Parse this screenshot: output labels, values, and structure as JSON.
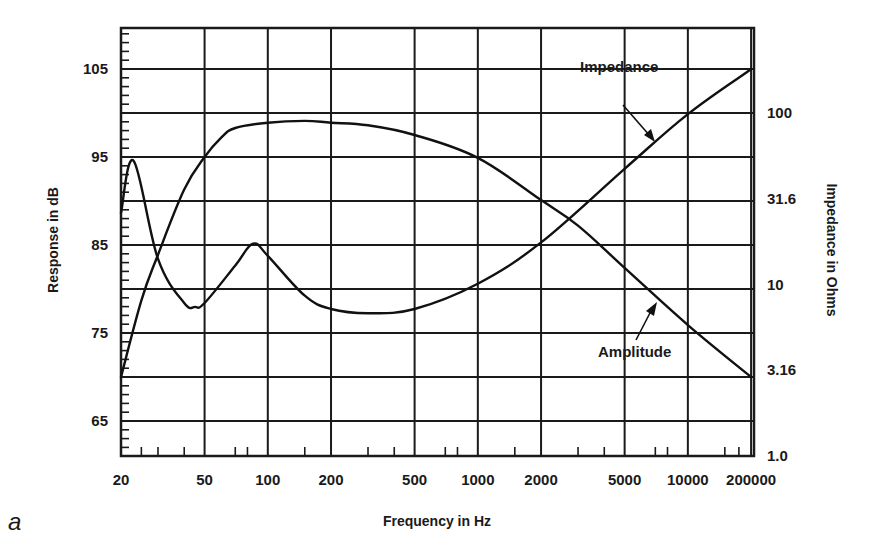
{
  "panel_label": "a",
  "chart_data": {
    "type": "line",
    "title": "",
    "xlabel": "Frequency in Hz",
    "ylabel": "Response in dB",
    "ylabel_right": "Impedance in Ohms",
    "xscale": "log",
    "xlim": [
      20,
      20000
    ],
    "ylim": [
      60,
      110
    ],
    "ylim_right": [
      1.0,
      316
    ],
    "grid": true,
    "x_tick_labels": [
      "20",
      "50",
      "100",
      "200",
      "500",
      "1000",
      "2000",
      "5000",
      "10000",
      "200000"
    ],
    "x_tick_values": [
      20,
      50,
      100,
      200,
      500,
      1000,
      2000,
      5000,
      10000,
      20000
    ],
    "y_tick_labels": [
      "105",
      "95",
      "85",
      "75",
      "65"
    ],
    "y_tick_values": [
      105,
      95,
      85,
      75,
      65
    ],
    "y_right_tick_labels": [
      "100",
      "31.6",
      "10",
      "3.16",
      "1.0"
    ],
    "y_right_tick_values": [
      100,
      31.6,
      10,
      3.16,
      1.0
    ],
    "series": [
      {
        "name": "Amplitude",
        "axis": "left",
        "unit": "dB",
        "x": [
          20,
          25,
          30,
          40,
          50,
          60,
          70,
          100,
          150,
          200,
          300,
          500,
          1000,
          2000,
          3000,
          5000,
          10000,
          20000
        ],
        "values": [
          70.0,
          78.7,
          83.9,
          91.3,
          95.0,
          97.2,
          98.3,
          98.9,
          99.1,
          98.9,
          98.6,
          97.5,
          94.9,
          90.1,
          87.2,
          82.4,
          75.9,
          70.0
        ]
      },
      {
        "name": "Impedance",
        "axis": "right",
        "unit": "Ohms",
        "x": [
          20,
          23,
          30,
          40,
          45,
          50,
          70,
          85,
          100,
          150,
          200,
          300,
          500,
          1000,
          2000,
          5000,
          10000,
          20000
        ],
        "values": [
          26.2,
          52.6,
          14.1,
          7.8,
          7.4,
          7.8,
          12.9,
          17.3,
          14.7,
          8.6,
          7.2,
          6.8,
          7.2,
          10.1,
          17.6,
          47.3,
          98.6,
          180
        ]
      }
    ],
    "annotations": [
      {
        "text": "Impedance",
        "arrow_to_series": "Impedance"
      },
      {
        "text": "Amplitude",
        "arrow_to_series": "Amplitude"
      }
    ]
  },
  "colors": {
    "ink": "#111111",
    "background": "#ffffff"
  }
}
